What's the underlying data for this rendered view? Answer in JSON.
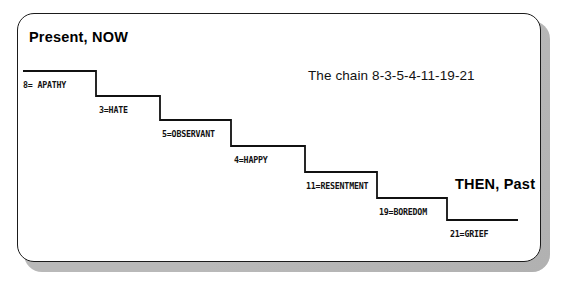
{
  "figure": {
    "type": "step-chart-diagram",
    "background_color": "#ffffff",
    "card_color": "#ffffff",
    "border_color": "#1b1b1b",
    "shadow_color": "#b9b9b9",
    "line_color": "#111111"
  },
  "headings": {
    "left": "Present, NOW",
    "right": "THEN, Past"
  },
  "caption": {
    "chain": "The chain 8-3-5-4-11-19-21"
  },
  "chart_data": {
    "type": "line",
    "title": "The chain 8-3-5-4-11-19-21",
    "xlabel": "",
    "ylabel": "",
    "grid": false,
    "legend": "none",
    "orientation": "descending-staircase",
    "x_axis_meaning": "time from Present, NOW (left) to THEN, Past (right)",
    "categories": [
      "8",
      "3",
      "5",
      "4",
      "11",
      "19",
      "21"
    ],
    "series": [
      {
        "name": "chain",
        "values": [
          8,
          3,
          5,
          4,
          11,
          19,
          21
        ]
      }
    ],
    "points": [
      {
        "number": "8",
        "label": "8= APATHY",
        "step_index": 1,
        "tread_y": 71,
        "tread_x0": 23,
        "tread_x1": 96
      },
      {
        "number": "3",
        "label": "3=HATE",
        "step_index": 2,
        "tread_y": 96,
        "tread_x0": 96,
        "tread_x1": 160
      },
      {
        "number": "5",
        "label": "5=OBSERVANT",
        "step_index": 3,
        "tread_y": 120,
        "tread_x0": 160,
        "tread_x1": 231
      },
      {
        "number": "4",
        "label": "4=HAPPY",
        "step_index": 4,
        "tread_y": 146,
        "tread_x0": 231,
        "tread_x1": 305
      },
      {
        "number": "11",
        "label": "11=RESENTMENT",
        "step_index": 5,
        "tread_y": 172,
        "tread_x0": 305,
        "tread_x1": 377
      },
      {
        "number": "19",
        "label": "19=BOREDOM",
        "step_index": 6,
        "tread_y": 198,
        "tread_x0": 377,
        "tread_x1": 447
      },
      {
        "number": "21",
        "label": "21=GRIEF",
        "step_index": 7,
        "tread_y": 220,
        "tread_x0": 447,
        "tread_x1": 518
      }
    ]
  },
  "steps": [
    {
      "label": "8= APATHY",
      "label_x": 23,
      "label_y": 80
    },
    {
      "label": "3=HATE",
      "label_x": 99,
      "label_y": 105
    },
    {
      "label": "5=OBSERVANT",
      "label_x": 162,
      "label_y": 129
    },
    {
      "label": "4=HAPPY",
      "label_x": 234,
      "label_y": 155
    },
    {
      "label": "11=RESENTMENT",
      "label_x": 306,
      "label_y": 181
    },
    {
      "label": "19=BOREDOM",
      "label_x": 379,
      "label_y": 207
    },
    {
      "label": "21=GRIEF",
      "label_x": 450,
      "label_y": 229
    }
  ]
}
